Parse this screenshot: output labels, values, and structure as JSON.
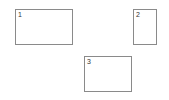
{
  "boxes": [
    {
      "label": "1"
    },
    {
      "label": "2"
    },
    {
      "label": "3"
    }
  ],
  "colors": {
    "background": "#ffffff",
    "border": "#8a8a8a",
    "text": "#333333"
  }
}
